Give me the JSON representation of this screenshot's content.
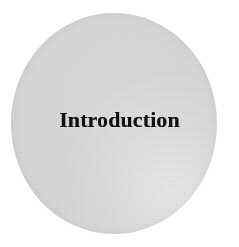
{
  "page": {
    "background_color": "#ffffff",
    "width": 239,
    "height": 247
  },
  "disc": {
    "name": "chapter-opener-disc",
    "shape": "circle",
    "fill_color": "#d8d8da",
    "edge_color": "#cfcfd1",
    "center_x": 114,
    "center_y": 123,
    "width": 206,
    "height": 221
  },
  "title": {
    "text": "Introduction",
    "color": "#121212",
    "style": "bold-serif",
    "font_size_px": 22,
    "align": "center"
  }
}
